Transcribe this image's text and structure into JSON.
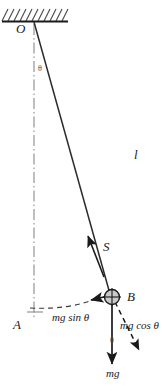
{
  "figure": {
    "points": {
      "pivot_label": "O",
      "rest_position_label": "A",
      "bob_label": "B"
    },
    "labels": {
      "string_length": "l",
      "tension": "S",
      "weight": "mg",
      "tangential_component": "mg sin θ",
      "radial_component": "mg cos θ",
      "angle_at_pivot": "θ",
      "angle_at_bob": "θ"
    },
    "colors": {
      "ink": "#1a1a1a",
      "stroke": "#2b2b2b",
      "dashed": "#3a3a3a",
      "axis_gray": "#8a8a8a",
      "bob_fill": "#c9c9c9",
      "hatch": "#4a4a4a"
    },
    "geometry": {
      "pivot": [
        34,
        22
      ],
      "bob": [
        112,
        297
      ],
      "rest_point": [
        34,
        312
      ],
      "ceiling_y": 22,
      "ceiling_x_start": 2,
      "ceiling_x_end": 68,
      "bob_radius": 8,
      "mg_arrow_end": [
        112,
        366
      ],
      "mgcos_arrow_end": [
        140,
        352
      ],
      "mgsin_arrow_end": [
        92,
        300
      ]
    }
  }
}
